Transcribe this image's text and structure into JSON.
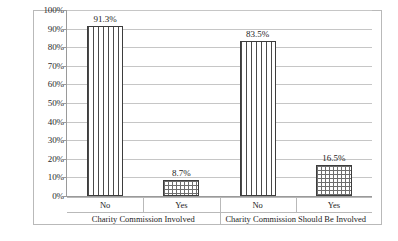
{
  "chart_data": {
    "type": "bar",
    "title": "",
    "subtitle": "",
    "xlabel": "",
    "ylabel": "",
    "ylim": [
      0,
      100
    ],
    "grid": true,
    "legend": "none",
    "value_suffix": "%",
    "y_ticks": [
      "0%",
      "10%",
      "20%",
      "30%",
      "40%",
      "50%",
      "60%",
      "70%",
      "80%",
      "90%",
      "100%"
    ],
    "y_tick_values": [
      0,
      10,
      20,
      30,
      40,
      50,
      60,
      70,
      80,
      90,
      100
    ],
    "groups": [
      {
        "label": "Charity Commission Involved",
        "categories": [
          "No",
          "Yes"
        ],
        "values": [
          91.3,
          8.7
        ],
        "data_labels": [
          "91.3%",
          "8.7%"
        ],
        "patterns": [
          "vstripe",
          "checker"
        ]
      },
      {
        "label": "Charity Commission Should Be Involved",
        "categories": [
          "No",
          "Yes"
        ],
        "values": [
          83.5,
          16.5
        ],
        "data_labels": [
          "83.5%",
          "16.5%"
        ],
        "patterns": [
          "vstripe",
          "checker"
        ]
      }
    ],
    "bars": [
      {
        "group": "Charity Commission Involved",
        "category": "No",
        "value": 91.3,
        "label": "91.3%",
        "pattern": "vstripe"
      },
      {
        "group": "Charity Commission Involved",
        "category": "Yes",
        "value": 8.7,
        "label": "8.7%",
        "pattern": "checker"
      },
      {
        "group": "Charity Commission Should Be Involved",
        "category": "No",
        "value": 83.5,
        "label": "83.5%",
        "pattern": "vstripe"
      },
      {
        "group": "Charity Commission Should Be Involved",
        "category": "Yes",
        "value": 16.5,
        "label": "16.5%",
        "pattern": "checker"
      }
    ],
    "colors": {
      "bar_outline": "#3d3d3d",
      "bar_fill": "#ffffff",
      "pattern_stroke": "#4a4a4a",
      "gridline": "#c6c6c6",
      "axis": "#9a9a9a",
      "frame": "#b9b9b9",
      "text": "#1d1d1d",
      "background": "#ffffff"
    }
  }
}
